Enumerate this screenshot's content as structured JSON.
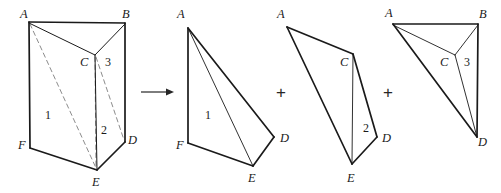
{
  "figure": {
    "width": 501,
    "height": 193,
    "stroke_color": "#1a1a1a",
    "thin_stroke_color": "#4a4a4a",
    "dashed_stroke_color": "#8c8c8c",
    "background": "#ffffff"
  },
  "operators": {
    "arrow": "→",
    "plus_1": "+",
    "plus_2": "+"
  },
  "panels": [
    {
      "id": "prism",
      "name": "triangular-prism",
      "vertex_labels": [
        {
          "text": "A",
          "x": 20,
          "y": 8
        },
        {
          "text": "B",
          "x": 122,
          "y": 8
        },
        {
          "text": "C",
          "x": 80,
          "y": 56
        },
        {
          "text": "F",
          "x": 18,
          "y": 139
        },
        {
          "text": "E",
          "x": 92,
          "y": 176
        },
        {
          "text": "D",
          "x": 128,
          "y": 134
        }
      ],
      "face_labels": [
        {
          "text": "1",
          "x": 45,
          "y": 109
        },
        {
          "text": "2",
          "x": 101,
          "y": 124
        },
        {
          "text": "3",
          "x": 105,
          "y": 56
        }
      ]
    },
    {
      "id": "tetra-1",
      "name": "tetrahedron-one",
      "vertex_labels": [
        {
          "text": "A",
          "x": 177,
          "y": 8
        },
        {
          "text": "F",
          "x": 176,
          "y": 139
        },
        {
          "text": "E",
          "x": 248,
          "y": 172
        },
        {
          "text": "D",
          "x": 280,
          "y": 132
        }
      ],
      "face_labels": [
        {
          "text": "1",
          "x": 205,
          "y": 109
        }
      ]
    },
    {
      "id": "tetra-2",
      "name": "tetrahedron-two",
      "vertex_labels": [
        {
          "text": "A",
          "x": 277,
          "y": 8
        },
        {
          "text": "C",
          "x": 340,
          "y": 56
        },
        {
          "text": "E",
          "x": 347,
          "y": 172
        },
        {
          "text": "D",
          "x": 382,
          "y": 132
        }
      ],
      "face_labels": [
        {
          "text": "2",
          "x": 363,
          "y": 122
        }
      ]
    },
    {
      "id": "tetra-3",
      "name": "tetrahedron-three",
      "vertex_labels": [
        {
          "text": "A",
          "x": 385,
          "y": 7
        },
        {
          "text": "B",
          "x": 479,
          "y": 8
        },
        {
          "text": "C",
          "x": 440,
          "y": 56
        },
        {
          "text": "D",
          "x": 478,
          "y": 136
        }
      ],
      "face_labels": [
        {
          "text": "3",
          "x": 464,
          "y": 56
        }
      ]
    }
  ],
  "geometry": {
    "prism": {
      "A": [
        29,
        22
      ],
      "B": [
        125,
        23
      ],
      "C": [
        95,
        55
      ],
      "F": [
        30,
        148
      ],
      "E": [
        97,
        170
      ],
      "D": [
        125,
        142
      ]
    },
    "tetra1": {
      "A": [
        188,
        28
      ],
      "F": [
        188,
        143
      ],
      "E": [
        253,
        166
      ],
      "D": [
        274,
        137
      ]
    },
    "tetra2": {
      "A": [
        287,
        27
      ],
      "C": [
        353,
        54
      ],
      "E": [
        352,
        164
      ],
      "D": [
        377,
        137
      ]
    },
    "tetra3": {
      "A": [
        393,
        24
      ],
      "B": [
        478,
        24
      ],
      "C": [
        455,
        55
      ],
      "D": [
        477,
        137
      ]
    }
  }
}
